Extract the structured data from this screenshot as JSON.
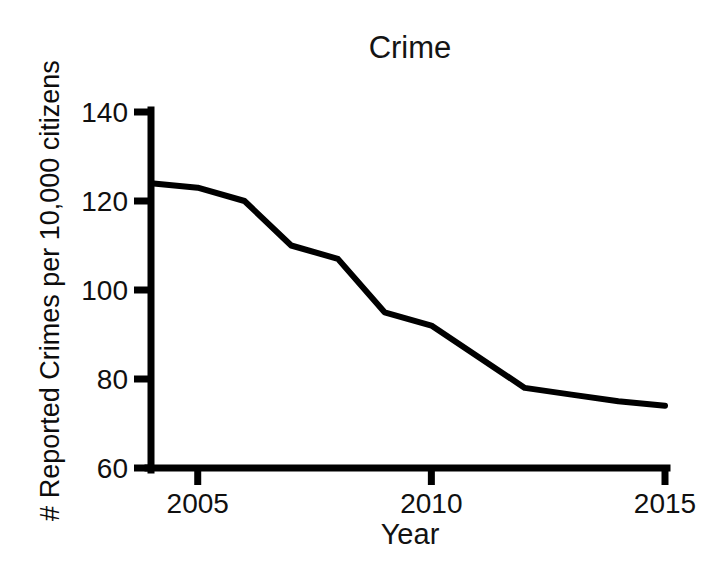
{
  "chart_data": {
    "type": "line",
    "title": "Crime",
    "xlabel": "Year",
    "ylabel": "# Reported Crimes per 10,000 citizens",
    "x": [
      2004,
      2005,
      2006,
      2007,
      2008,
      2009,
      2010,
      2011,
      2012,
      2013,
      2014,
      2015
    ],
    "values": [
      124,
      123,
      120,
      110,
      107,
      95,
      92,
      85,
      78,
      76.5,
      75,
      74
    ],
    "series": [
      {
        "name": "Reported Crimes per 10,000 citizens",
        "values": [
          124,
          123,
          120,
          110,
          107,
          95,
          92,
          85,
          78,
          76.5,
          75,
          74
        ]
      }
    ],
    "xlim": [
      2004,
      2015
    ],
    "ylim": [
      60,
      140
    ],
    "x_ticks": [
      2005,
      2010,
      2015
    ],
    "x_tick_labels": [
      "2005",
      "2010",
      "2015"
    ],
    "y_ticks": [
      60,
      80,
      100,
      120,
      140
    ],
    "y_tick_labels": [
      "60",
      "80",
      "100",
      "120",
      "140"
    ],
    "grid": false,
    "legend": "none",
    "line_color": "#000000",
    "line_width": 6,
    "axis_color": "#000000"
  },
  "chart": {
    "title": "Crime",
    "x_axis_label": "Year",
    "y_axis_label": "# Reported Crimes per 10,000 citizens",
    "x_tick_labels": [
      "2005",
      "2010",
      "2015"
    ],
    "y_tick_labels": [
      "140",
      "120",
      "100",
      "80",
      "60"
    ]
  }
}
